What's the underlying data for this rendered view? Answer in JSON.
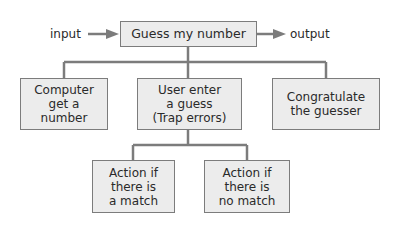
{
  "diagram": {
    "title": "Guess my number",
    "input_label": "input",
    "output_label": "output",
    "root": {
      "id": "root",
      "text": "Guess my number"
    },
    "children": [
      {
        "id": "computer-get-number",
        "text": "Computer\nget a\nnumber"
      },
      {
        "id": "user-enter-guess",
        "text": "User enter\na guess\n(Trap errors)"
      },
      {
        "id": "congratulate",
        "text": "Congratulate\nthe guesser"
      }
    ],
    "grandchildren": [
      {
        "id": "action-match",
        "parent": "user-enter-guess",
        "text": "Action if\nthere is\na match"
      },
      {
        "id": "action-no-match",
        "parent": "user-enter-guess",
        "text": "Action if\nthere is\nno match"
      }
    ],
    "colors": {
      "box_fill": "#ececec",
      "box_border": "#7c7c7c",
      "line": "#7c7c7c",
      "text": "#2a2a2a"
    }
  }
}
